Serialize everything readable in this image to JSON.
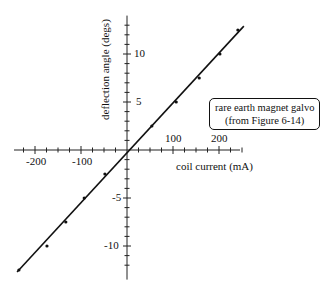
{
  "chart_data": {
    "type": "scatter",
    "title": "",
    "xlabel": "coil current (mA)",
    "ylabel": "deflection angle (degs)",
    "x_ticks": [
      -200,
      -100,
      100,
      200
    ],
    "y_ticks": [
      -10,
      -5,
      5,
      10
    ],
    "x_tick_labels": [
      "-200",
      "-100",
      "100",
      "200"
    ],
    "y_tick_labels": [
      "-10",
      "-5",
      "5",
      "10"
    ],
    "xlim": [
      -250,
      250
    ],
    "ylim": [
      -13.5,
      14
    ],
    "grid": false,
    "series": [
      {
        "name": "measured",
        "x": [
          -235,
          -174,
          -133,
          -93,
          -48,
          54,
          107,
          157,
          202,
          241
        ],
        "y": [
          -12.5,
          -10.0,
          -7.5,
          -5.0,
          -2.5,
          2.5,
          5.0,
          7.5,
          10.0,
          12.5
        ]
      },
      {
        "name": "fit line",
        "x": [
          -239,
          254
        ],
        "y": [
          -12.7,
          12.9
        ]
      }
    ],
    "annotation": {
      "line1": "rare earth magnet galvo",
      "line2": "(from Figure 6-14)"
    }
  }
}
